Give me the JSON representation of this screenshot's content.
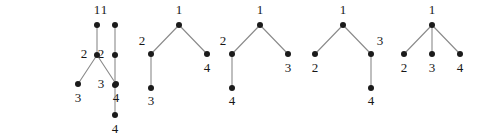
{
  "figure": {
    "kind": "labelled-tree-collection",
    "background_color": "#ffffff",
    "node_color": "#1b1b1b",
    "edge_color": "#8a8a8a",
    "label_color": "#171717",
    "node_radius": 3,
    "trees": [
      {
        "name": "tree-1",
        "nodes": [
          {
            "label": "1",
            "x": 115,
            "y": 25,
            "label_x": 104,
            "label_y": 11,
            "label_anchor": "middle"
          },
          {
            "label": "2",
            "x": 115,
            "y": 55,
            "label_x": 101,
            "label_y": 55,
            "label_anchor": "middle"
          },
          {
            "label": "3",
            "x": 115,
            "y": 85,
            "label_x": 101,
            "label_y": 85,
            "label_anchor": "middle"
          },
          {
            "label": "4",
            "x": 115,
            "y": 115,
            "label_x": 115,
            "label_y": 130,
            "label_anchor": "middle"
          }
        ],
        "edges": [
          [
            0,
            1
          ],
          [
            1,
            2
          ],
          [
            2,
            3
          ]
        ]
      },
      {
        "name": "tree-2",
        "nodes": [
          {
            "label": "1",
            "x": 97,
            "y": 25,
            "label_x": 97,
            "label_y": 11,
            "label_anchor": "middle"
          },
          {
            "label": "2",
            "x": 97,
            "y": 55,
            "label_x": 84,
            "label_y": 55,
            "label_anchor": "middle"
          },
          {
            "label": "3",
            "x": 78,
            "y": 84,
            "label_x": 78,
            "label_y": 99,
            "label_anchor": "middle"
          },
          {
            "label": "4",
            "x": 116,
            "y": 84,
            "label_x": 116,
            "label_y": 99,
            "label_anchor": "middle"
          }
        ],
        "edges": [
          [
            0,
            1
          ],
          [
            1,
            2
          ],
          [
            1,
            3
          ]
        ]
      },
      {
        "name": "tree-3",
        "nodes": [
          {
            "label": "1",
            "x": 179,
            "y": 25,
            "label_x": 179,
            "label_y": 11,
            "label_anchor": "middle"
          },
          {
            "label": "2",
            "x": 151,
            "y": 54,
            "label_x": 142,
            "label_y": 42,
            "label_anchor": "middle"
          },
          {
            "label": "3",
            "x": 151,
            "y": 88,
            "label_x": 151,
            "label_y": 102,
            "label_anchor": "middle"
          },
          {
            "label": "4",
            "x": 207,
            "y": 54,
            "label_x": 207,
            "label_y": 69,
            "label_anchor": "middle"
          }
        ],
        "edges": [
          [
            0,
            1
          ],
          [
            0,
            3
          ],
          [
            1,
            2
          ]
        ]
      },
      {
        "name": "tree-4",
        "nodes": [
          {
            "label": "1",
            "x": 260,
            "y": 25,
            "label_x": 260,
            "label_y": 11,
            "label_anchor": "middle"
          },
          {
            "label": "2",
            "x": 232,
            "y": 54,
            "label_x": 223,
            "label_y": 42,
            "label_anchor": "middle"
          },
          {
            "label": "3",
            "x": 288,
            "y": 54,
            "label_x": 288,
            "label_y": 69,
            "label_anchor": "middle"
          },
          {
            "label": "4",
            "x": 232,
            "y": 88,
            "label_x": 232,
            "label_y": 102,
            "label_anchor": "middle"
          }
        ],
        "edges": [
          [
            0,
            1
          ],
          [
            0,
            2
          ],
          [
            1,
            3
          ]
        ]
      },
      {
        "name": "tree-5",
        "nodes": [
          {
            "label": "1",
            "x": 343,
            "y": 25,
            "label_x": 343,
            "label_y": 11,
            "label_anchor": "middle"
          },
          {
            "label": "2",
            "x": 315,
            "y": 54,
            "label_x": 315,
            "label_y": 69,
            "label_anchor": "middle"
          },
          {
            "label": "3",
            "x": 371,
            "y": 54,
            "label_x": 380,
            "label_y": 42,
            "label_anchor": "middle"
          },
          {
            "label": "4",
            "x": 371,
            "y": 88,
            "label_x": 371,
            "label_y": 102,
            "label_anchor": "middle"
          }
        ],
        "edges": [
          [
            0,
            1
          ],
          [
            0,
            2
          ],
          [
            2,
            3
          ]
        ]
      },
      {
        "name": "tree-6",
        "nodes": [
          {
            "label": "1",
            "x": 432,
            "y": 25,
            "label_x": 432,
            "label_y": 11,
            "label_anchor": "middle"
          },
          {
            "label": "2",
            "x": 404,
            "y": 54,
            "label_x": 404,
            "label_y": 69,
            "label_anchor": "middle"
          },
          {
            "label": "3",
            "x": 432,
            "y": 54,
            "label_x": 432,
            "label_y": 69,
            "label_anchor": "middle"
          },
          {
            "label": "4",
            "x": 460,
            "y": 54,
            "label_x": 460,
            "label_y": 69,
            "label_anchor": "middle"
          }
        ],
        "edges": [
          [
            0,
            1
          ],
          [
            0,
            2
          ],
          [
            0,
            3
          ]
        ]
      }
    ]
  }
}
